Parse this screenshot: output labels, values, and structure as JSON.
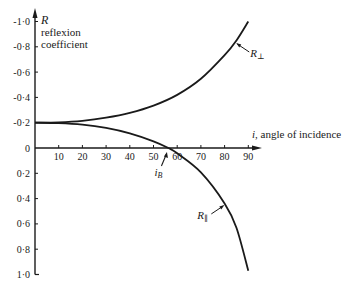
{
  "chart_data": {
    "type": "line",
    "title": "",
    "ylabel_symbol": "R",
    "ylabel_line1": "reflexion",
    "ylabel_line2": "coefficient",
    "xlabel_symbol": "i",
    "xlabel": ", angle of incidence",
    "xlim": [
      0,
      92
    ],
    "ylim": [
      -1.0,
      1.0
    ],
    "y_axis_inverted_note": "negative values plotted upward",
    "x_ticks": [
      10,
      20,
      30,
      40,
      50,
      60,
      70,
      80,
      90
    ],
    "x_tick_labels": [
      "10",
      "20",
      "30",
      "40",
      "50",
      "60",
      "70",
      "80",
      "90"
    ],
    "y_ticks": [
      -1.0,
      -0.8,
      -0.6,
      -0.4,
      -0.2,
      0,
      0.2,
      0.4,
      0.6,
      0.8,
      1.0
    ],
    "y_tick_labels": [
      "-1·0",
      "-0·8",
      "-0·6",
      "-0·4",
      "-0·2",
      "0",
      "0·2",
      "0·4",
      "0·6",
      "0·8",
      "1·0"
    ],
    "grid": false,
    "series": [
      {
        "name": "R⊥",
        "label_main": "R",
        "label_sub": "⊥",
        "x": [
          0,
          10,
          20,
          30,
          40,
          50,
          60,
          70,
          80,
          85,
          90
        ],
        "values": [
          -0.2,
          -0.203,
          -0.215,
          -0.24,
          -0.278,
          -0.335,
          -0.42,
          -0.547,
          -0.734,
          -0.85,
          -1.0
        ]
      },
      {
        "name": "R∥",
        "label_main": "R",
        "label_sub": "∥",
        "x": [
          0,
          10,
          20,
          30,
          40,
          50,
          56.3,
          60,
          70,
          80,
          85,
          90
        ],
        "values": [
          -0.2,
          -0.197,
          -0.185,
          -0.159,
          -0.116,
          -0.053,
          0,
          0.042,
          0.193,
          0.438,
          0.63,
          0.97
        ]
      }
    ],
    "annotations": [
      {
        "text_main": "i",
        "text_sub": "B",
        "meaning": "Brewster angle",
        "x": 56.3,
        "y": 0
      }
    ]
  }
}
